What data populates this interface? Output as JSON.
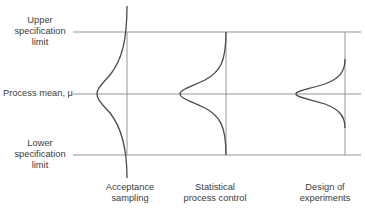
{
  "diagram": {
    "left_labels": {
      "upper": [
        "Upper",
        "specification",
        "limit"
      ],
      "mean": "Process mean, μ",
      "lower": [
        "Lower",
        "specification",
        "limit"
      ]
    },
    "bottom_labels": {
      "acceptance": [
        "Acceptance",
        "sampling"
      ],
      "spc": [
        "Statistical",
        "process control"
      ],
      "doe": [
        "Design of",
        "experiments"
      ]
    },
    "line_color": "#7a7a7a",
    "curve_color": "#4a4a4a"
  }
}
